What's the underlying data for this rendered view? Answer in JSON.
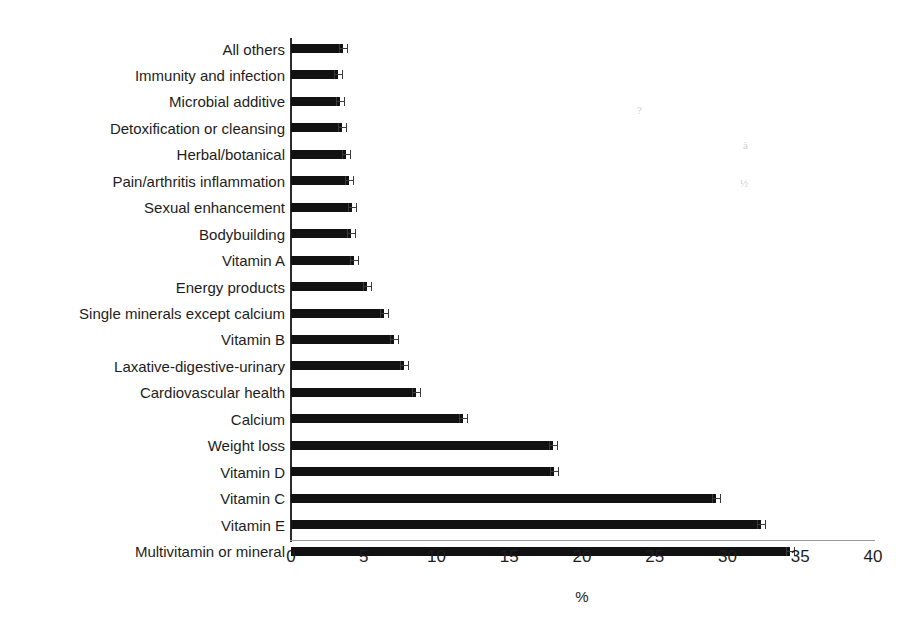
{
  "chart_data": {
    "type": "bar",
    "orientation": "horizontal",
    "title": "",
    "subtitle": "",
    "xlabel": "%",
    "ylabel": "",
    "xlim": [
      0,
      40
    ],
    "xticks": [
      0,
      5,
      10,
      15,
      20,
      25,
      30,
      35,
      40
    ],
    "xtick_labels": [
      "0",
      "5",
      "10",
      "15",
      "20",
      "25",
      "30",
      "35",
      "40"
    ],
    "grid": false,
    "legend": null,
    "bar_color": "#111111",
    "axis_color": "#2b2b2b",
    "error_bars": true,
    "categories": [
      "All others",
      "Immunity and infection",
      "Microbial additive",
      "Detoxification or cleansing",
      "Herbal/botanical",
      "Pain/arthritis inflammation",
      "Sexual enhancement",
      "Bodybuilding",
      "Vitamin A",
      "Energy products",
      "Single minerals except calcium",
      "Vitamin B",
      "Laxative-digestive-urinary",
      "Cardiovascular health",
      "Calcium",
      "Weight loss",
      "Vitamin D",
      "Vitamin C",
      "Vitamin E",
      "Multivitamin or mineral"
    ],
    "values": [
      3.6,
      3.2,
      3.4,
      3.5,
      3.8,
      4.0,
      4.2,
      4.1,
      4.3,
      5.2,
      6.4,
      7.1,
      7.8,
      8.6,
      11.8,
      18.0,
      18.1,
      29.2,
      32.3,
      34.3
    ],
    "errors": [
      0.3,
      0.3,
      0.3,
      0.3,
      0.3,
      0.3,
      0.3,
      0.3,
      0.3,
      0.3,
      0.3,
      0.3,
      0.3,
      0.3,
      0.3,
      0.3,
      0.3,
      0.3,
      0.3,
      0.3
    ]
  },
  "artifacts": [
    {
      "text": "?",
      "x": 637,
      "y": 104
    },
    {
      "text": "à",
      "x": 743,
      "y": 139
    },
    {
      "text": "½",
      "x": 740,
      "y": 177
    }
  ]
}
